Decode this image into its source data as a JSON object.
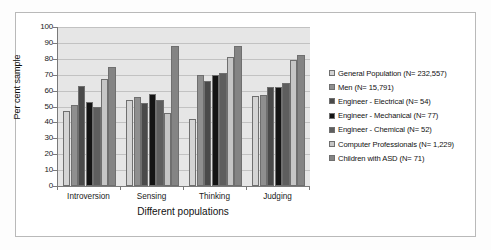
{
  "chart_data": {
    "type": "bar",
    "title": "",
    "xlabel": "Different populations",
    "ylabel": "Per cent sample",
    "ylim": [
      0,
      100
    ],
    "ytick_step": 10,
    "yticks": [
      0,
      10,
      20,
      30,
      40,
      50,
      60,
      70,
      80,
      90,
      100
    ],
    "grid": true,
    "legend_position": "right",
    "categories": [
      "Introversion",
      "Sensing",
      "Thinking",
      "Judging"
    ],
    "series": [
      {
        "name": "General Population (N= 232,557)",
        "color": "#d4d4d4",
        "values": [
          47,
          54,
          42,
          56.5
        ]
      },
      {
        "name": "Men (N= 15,791)",
        "color": "#8f8f8f",
        "values": [
          51,
          56,
          70,
          57.5
        ]
      },
      {
        "name": "Engineer - Electrical (N= 54)",
        "color": "#4a4a4a",
        "values": [
          63,
          52,
          66,
          62.5
        ]
      },
      {
        "name": "Engineer - Mechanical  (N= 77)",
        "color": "#141414",
        "values": [
          53,
          58,
          70,
          62
        ]
      },
      {
        "name": "Engineer - Chemical (N= 52)",
        "color": "#5e5e5e",
        "values": [
          50,
          54,
          71,
          65
        ]
      },
      {
        "name": "Computer Professionals (N= 1,229)",
        "color": "#c6c6c6",
        "values": [
          67,
          46,
          81,
          79
        ]
      },
      {
        "name": "Children with ASD (N= 71)",
        "color": "#848484",
        "values": [
          75,
          88,
          88,
          82.5
        ]
      }
    ]
  },
  "axes": {
    "y_title": "Per cent sample",
    "x_title": "Different populations"
  },
  "colors": {
    "plot_background": "#e6e6e6",
    "gridline": "#c2c2c2",
    "axis_line": "#7a7a7a",
    "frame": "#b9b9b9",
    "text": "#111111"
  }
}
